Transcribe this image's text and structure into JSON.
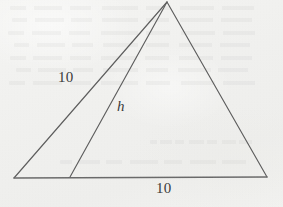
{
  "figure": {
    "kind": "geometry-diagram",
    "background_color": "#f1f1ef",
    "ink_color": "#5e5e5e",
    "text_color": "#3b3b3b",
    "labels": {
      "left_side": "10",
      "height": "h",
      "base": "10"
    },
    "vertices": {
      "apex": {
        "x": 167,
        "y": 2
      },
      "bottom_left": {
        "x": 14,
        "y": 178
      },
      "bottom_right": {
        "x": 267,
        "y": 177
      },
      "cevian_foot": {
        "x": 70,
        "y": 177
      }
    },
    "segments": [
      {
        "name": "left-side",
        "from": "bottom_left",
        "to": "apex",
        "label": "10"
      },
      {
        "name": "right-side",
        "from": "apex",
        "to": "bottom_right",
        "label": ""
      },
      {
        "name": "base",
        "from": "bottom_left",
        "to": "bottom_right",
        "label": "10"
      },
      {
        "name": "cevian-height",
        "from": "apex",
        "to": "cevian_foot",
        "label": "h"
      }
    ],
    "bleed_lines": [
      {
        "top": 6,
        "left": 10,
        "width": 262
      },
      {
        "top": 18,
        "left": 12,
        "width": 258
      },
      {
        "top": 31,
        "left": 8,
        "width": 266
      },
      {
        "top": 43,
        "left": 14,
        "width": 254
      },
      {
        "top": 56,
        "left": 10,
        "width": 260
      },
      {
        "top": 68,
        "left": 16,
        "width": 250
      },
      {
        "top": 81,
        "left": 9,
        "width": 264
      },
      {
        "top": 140,
        "left": 150,
        "width": 110
      },
      {
        "top": 160,
        "left": 60,
        "width": 200
      }
    ]
  }
}
